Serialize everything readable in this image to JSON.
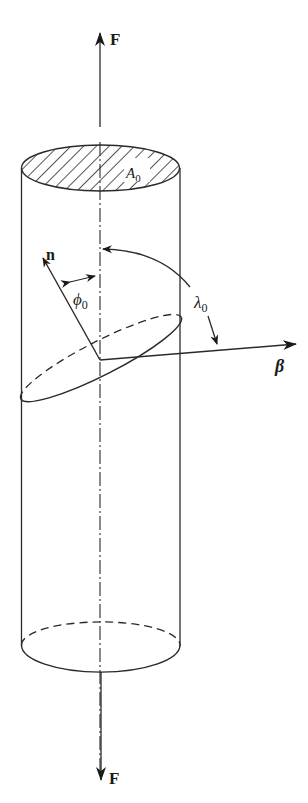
{
  "diagram": {
    "type": "schmid-law-single-crystal-cylinder",
    "colors": {
      "stroke": "#2a2a2a",
      "background": "#ffffff"
    },
    "labels": {
      "force_top": "F",
      "force_bottom": "F",
      "area": "A",
      "area_sub": "0",
      "normal": "n",
      "phi": "ϕ",
      "phi_sub": "0",
      "lambda": "λ",
      "lambda_sub": "0",
      "slip_direction": "β"
    }
  }
}
